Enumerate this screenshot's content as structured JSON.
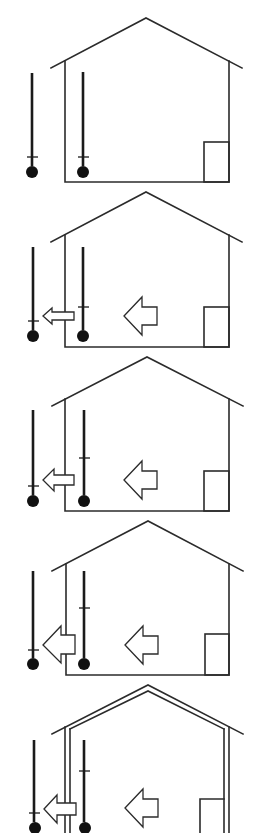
{
  "diagram": {
    "type": "heat-loss-sequence",
    "panel_count": 5,
    "colors": {
      "stroke": "#2b2b2b",
      "thermometer": "#111111",
      "background": "#ffffff"
    },
    "panels": [
      {
        "index": 1,
        "top": 15,
        "wall": "single",
        "outdoor_thermometer": {
          "tick_level": "low"
        },
        "indoor_thermometer": {
          "tick_level": "low"
        },
        "inner_arrow": false,
        "wall_arrow": "none"
      },
      {
        "index": 2,
        "top": 190,
        "wall": "single",
        "outdoor_thermometer": {
          "tick_level": "low"
        },
        "indoor_thermometer": {
          "tick_level": "mid-low"
        },
        "inner_arrow": true,
        "wall_arrow": "small"
      },
      {
        "index": 3,
        "top": 355,
        "wall": "single",
        "outdoor_thermometer": {
          "tick_level": "low"
        },
        "indoor_thermometer": {
          "tick_level": "mid"
        },
        "inner_arrow": true,
        "wall_arrow": "small"
      },
      {
        "index": 4,
        "top": 520,
        "wall": "single",
        "outdoor_thermometer": {
          "tick_level": "low"
        },
        "indoor_thermometer": {
          "tick_level": "high"
        },
        "inner_arrow": true,
        "wall_arrow": "large"
      },
      {
        "index": 5,
        "top": 685,
        "wall": "double-insulated",
        "outdoor_thermometer": {
          "tick_level": "low"
        },
        "indoor_thermometer": {
          "tick_level": "high"
        },
        "inner_arrow": true,
        "wall_arrow": "small"
      }
    ]
  }
}
